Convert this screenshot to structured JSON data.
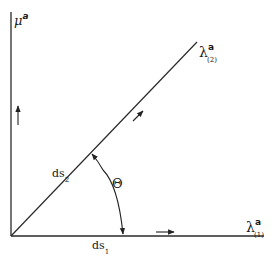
{
  "diagram": {
    "axes": {
      "vertical": {
        "symbol": "μ",
        "superscript": "a"
      },
      "horizontal": {
        "symbol": "λ",
        "superscript": "a",
        "subscript": "(1)"
      }
    },
    "diagonal": {
      "symbol": "λ",
      "superscript": "a",
      "subscript": "(2)"
    },
    "labels": {
      "ds2": {
        "main": "ds",
        "sub": "2"
      },
      "ds1": {
        "main": "ds",
        "sub": "1"
      },
      "angle": "Θ"
    },
    "colors": {
      "stroke": "#2a2a2a",
      "background": "#ffffff"
    }
  }
}
